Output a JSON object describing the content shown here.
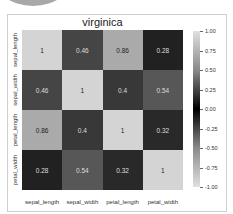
{
  "chart_data": {
    "type": "heatmap",
    "title": "virginica",
    "xlabel": "",
    "ylabel": "",
    "x_categories": [
      "sepal_length",
      "sepal_width",
      "petal_length",
      "petal_width"
    ],
    "y_categories": [
      "sepal_length",
      "sepal_width",
      "petal_length",
      "petal_width"
    ],
    "values": [
      [
        1,
        0.46,
        0.86,
        0.28
      ],
      [
        0.46,
        1,
        0.4,
        0.54
      ],
      [
        0.86,
        0.4,
        1,
        0.32
      ],
      [
        0.28,
        0.54,
        0.32,
        1
      ]
    ],
    "annotations": [
      [
        "1",
        "0.46",
        "0.86",
        "0.28"
      ],
      [
        "0.46",
        "1",
        "0.4",
        "0.54"
      ],
      [
        "0.86",
        "0.4",
        "1",
        "0.32"
      ],
      [
        "0.28",
        "0.54",
        "0.32",
        "1"
      ]
    ],
    "colorbar": {
      "range": [
        -1.0,
        1.0
      ],
      "ticks": [
        "1.00",
        "0.75",
        "0.50",
        "0.25",
        "0.00",
        "-0.25",
        "-0.50",
        "-0.75",
        "-1.00"
      ],
      "colormap": "diverging grayscale (light at ±1, black at 0)"
    },
    "grid": false,
    "legend_position": "right"
  }
}
